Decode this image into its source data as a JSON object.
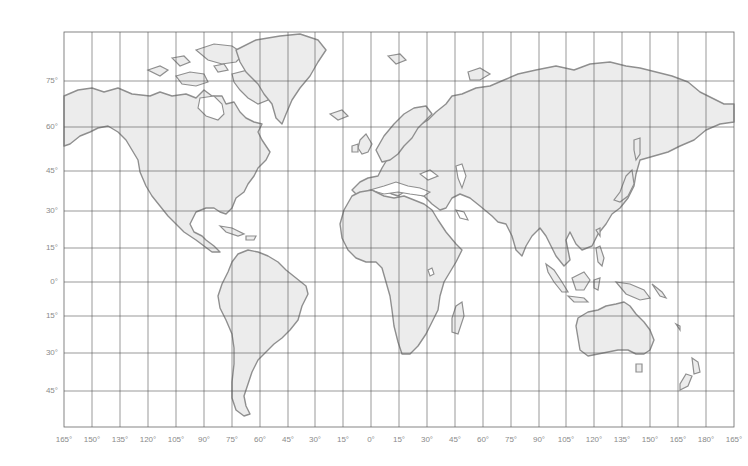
{
  "map": {
    "type": "world outline map",
    "projection": "Miller-like cylindrical",
    "colors": {
      "land": "#ececec",
      "coast": "#8f8f8f",
      "grid": "#555555",
      "label": "#8a8a8a",
      "background": "#ffffff"
    },
    "latitude_labels": [
      "75°",
      "60°",
      "45°",
      "30°",
      "15°",
      "0°",
      "15°",
      "30°",
      "45°"
    ],
    "longitude_labels": [
      "165°",
      "150°",
      "135°",
      "120°",
      "105°",
      "90°",
      "75°",
      "60°",
      "45°",
      "30°",
      "15°",
      "0°",
      "15°",
      "30°",
      "45°",
      "60°",
      "75°",
      "90°",
      "105°",
      "120°",
      "135°",
      "150°",
      "165°",
      "180°",
      "165°"
    ],
    "continents": [
      "North America",
      "Greenland",
      "South America",
      "Europe",
      "Africa",
      "Asia",
      "Australia",
      "Antarctica-free"
    ]
  }
}
